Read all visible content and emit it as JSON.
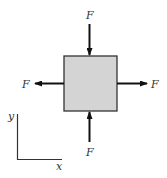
{
  "diagram": {
    "element": {
      "fill": "#d4d4d4",
      "stroke": "#333333"
    },
    "forces": [
      {
        "id": "top",
        "label": "F",
        "direction": "down"
      },
      {
        "id": "left",
        "label": "F",
        "direction": "left"
      },
      {
        "id": "right",
        "label": "F",
        "direction": "right"
      },
      {
        "id": "bottom",
        "label": "F",
        "direction": "up"
      }
    ],
    "axes": {
      "x_label": "x",
      "y_label": "y"
    }
  }
}
